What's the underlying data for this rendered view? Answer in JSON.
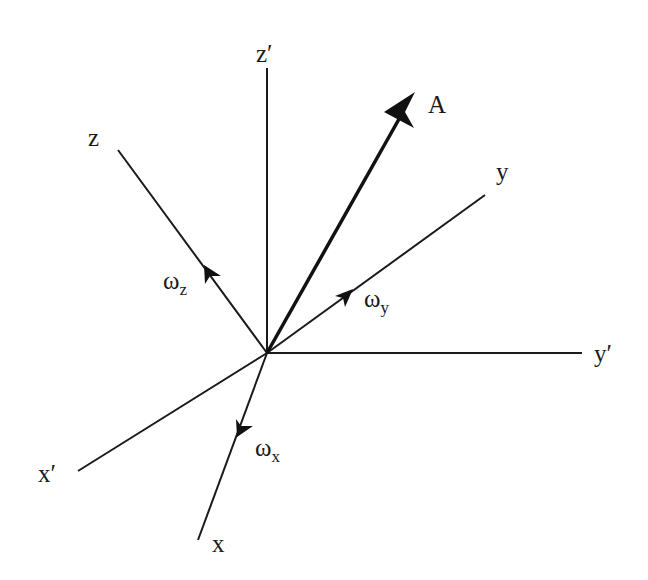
{
  "diagram": {
    "origin": [
      267,
      353
    ],
    "axes": {
      "z_prime": {
        "label": "z",
        "prime": "′",
        "end": [
          267,
          68
        ]
      },
      "y_prime": {
        "label": "y",
        "prime": "′",
        "end": [
          582,
          353
        ]
      },
      "x_prime": {
        "label": "x",
        "prime": "′",
        "end": [
          78,
          471
        ]
      },
      "z": {
        "label": "z",
        "end": [
          118,
          150
        ]
      },
      "y": {
        "label": "y",
        "end": [
          485,
          195
        ]
      },
      "x": {
        "label": "x",
        "end": [
          198,
          540
        ]
      }
    },
    "vector_A": {
      "label": "A",
      "tip": [
        415,
        92
      ]
    },
    "angular_velocities": {
      "omega_z": {
        "symbol": "ω",
        "subscript": "z"
      },
      "omega_y": {
        "symbol": "ω",
        "subscript": "y"
      },
      "omega_x": {
        "symbol": "ω",
        "subscript": "x"
      }
    }
  }
}
